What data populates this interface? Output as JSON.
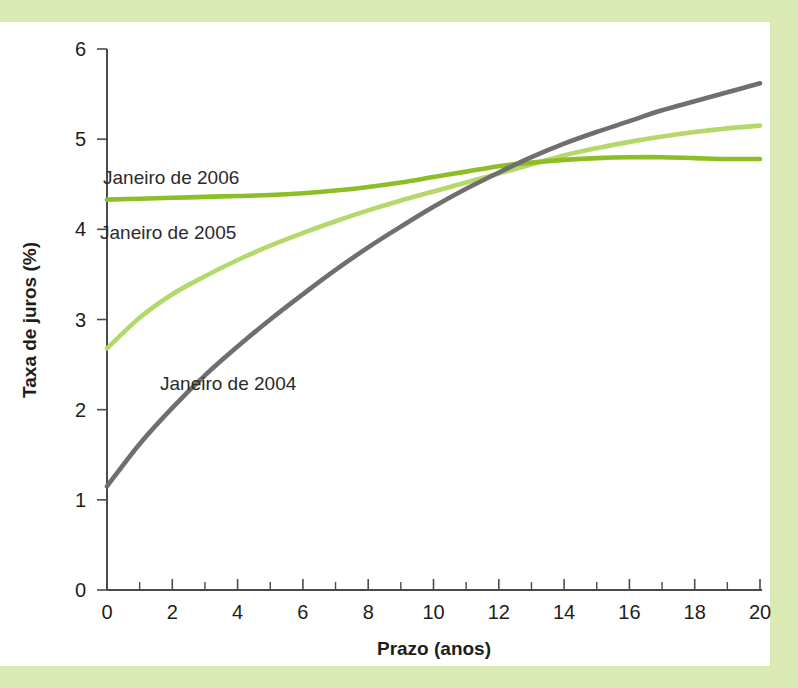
{
  "page": {
    "background_band_color": "#dbe9b4",
    "plate_color": "#ffffff"
  },
  "chart_data": {
    "type": "line",
    "title": "",
    "xlabel": "Prazo (anos)",
    "ylabel": "Taxa de juros (%)",
    "xlim": [
      0,
      20
    ],
    "ylim": [
      0,
      6
    ],
    "xticks": [
      0,
      2,
      4,
      6,
      8,
      10,
      12,
      14,
      16,
      18,
      20
    ],
    "xtick_labels": [
      "0",
      "2",
      "4",
      "6",
      "8",
      "10",
      "12",
      "14",
      "16",
      "18",
      "20"
    ],
    "xminor_ticks": [
      1,
      3,
      5,
      7,
      9,
      11,
      13,
      15,
      17,
      19
    ],
    "yticks": [
      0,
      1,
      2,
      3,
      4,
      5,
      6
    ],
    "ytick_labels": [
      "0",
      "1",
      "2",
      "3",
      "4",
      "5",
      "6"
    ],
    "grid": false,
    "legend_position": "inline-annotations",
    "x": [
      0,
      1,
      2,
      3,
      4,
      5,
      6,
      7,
      8,
      9,
      10,
      11,
      12,
      13,
      14,
      15,
      16,
      17,
      18,
      19,
      20
    ],
    "series": [
      {
        "name": "Janeiro de 2004",
        "color": "#6f6f6f",
        "values": [
          1.15,
          1.62,
          2.02,
          2.38,
          2.7,
          3.0,
          3.28,
          3.55,
          3.8,
          4.03,
          4.25,
          4.45,
          4.63,
          4.8,
          4.95,
          5.08,
          5.2,
          5.32,
          5.42,
          5.52,
          5.62
        ]
      },
      {
        "name": "Janeiro de 2005",
        "color": "#b4d96a",
        "values": [
          2.68,
          3.02,
          3.28,
          3.48,
          3.66,
          3.82,
          3.96,
          4.09,
          4.21,
          4.32,
          4.42,
          4.52,
          4.62,
          4.72,
          4.82,
          4.9,
          4.97,
          5.03,
          5.08,
          5.12,
          5.15
        ]
      },
      {
        "name": "Janeiro de 2006",
        "color": "#8ebe26",
        "values": [
          4.33,
          4.34,
          4.35,
          4.36,
          4.37,
          4.38,
          4.4,
          4.43,
          4.47,
          4.52,
          4.58,
          4.64,
          4.7,
          4.74,
          4.77,
          4.79,
          4.8,
          4.8,
          4.79,
          4.78,
          4.78
        ]
      }
    ],
    "annotations": [
      {
        "text": "Janeiro de 2006",
        "x_px": 103,
        "y_px": 184,
        "color": "#2b2b2b"
      },
      {
        "text": "Janeiro de 2005",
        "x_px": 100,
        "y_px": 239,
        "color": "#2b2b2b"
      },
      {
        "text": "Janeiro de 2004",
        "x_px": 160,
        "y_px": 390,
        "color": "#2b2b2b"
      }
    ]
  }
}
